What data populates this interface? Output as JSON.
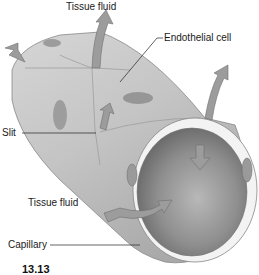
{
  "diagram": {
    "labels": {
      "tissue_fluid_top": "Tissue fluid",
      "endothelial_cell": "Endothelial cell",
      "slit": "Slit",
      "tissue_fluid_bottom": "Tissue fluid",
      "capillary": "Capillary"
    },
    "figure_number": "13.13",
    "colors": {
      "vessel_outer": "#c9c9c9",
      "vessel_shade": "#a8a8a8",
      "lumen": "#8e8e8e",
      "nucleus": "#8a8a8a",
      "arrow": "#9a9a9a",
      "wall_highlight": "#f2f2f2"
    }
  }
}
